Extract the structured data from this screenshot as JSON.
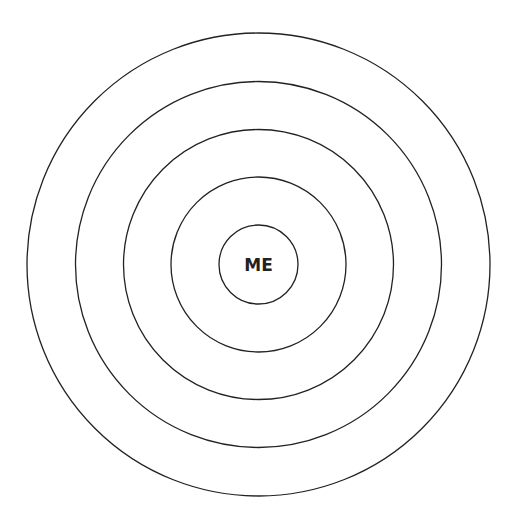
{
  "diagram": {
    "type": "concentric-circles",
    "center": {
      "x": 258.5,
      "y": 264.5
    },
    "stroke_color": "#222222",
    "background": "#ffffff",
    "rings": [
      {
        "name": "ring-1",
        "radius": 39.5
      },
      {
        "name": "ring-2",
        "radius": 87.5
      },
      {
        "name": "ring-3",
        "radius": 135
      },
      {
        "name": "ring-4",
        "radius": 183
      },
      {
        "name": "ring-5",
        "radius": 231.5
      }
    ],
    "center_label": "ME"
  }
}
